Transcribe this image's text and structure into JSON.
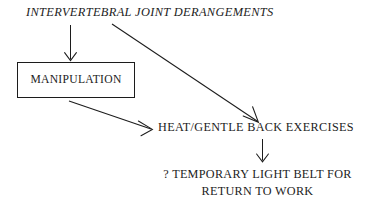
{
  "diagram": {
    "type": "flowchart",
    "title_node": "INTERVERTEBRAL JOINT DERANGEMENTS",
    "background_color": "#ffffff",
    "ink_color": "#1c1c1c",
    "nodes": [
      {
        "id": "derangements",
        "label": "INTERVERTEBRAL JOINT DERANGEMENTS",
        "style": "italic-caps",
        "boxed": false
      },
      {
        "id": "manipulation",
        "label": "MANIPULATION",
        "style": "roman-caps",
        "boxed": true
      },
      {
        "id": "heat",
        "label": "HEAT/GENTLE BACK EXERCISES",
        "style": "roman-caps",
        "boxed": false
      },
      {
        "id": "belt",
        "label_line_1": "? TEMPORARY LIGHT BELT FOR",
        "label_line_2": "RETURN TO WORK",
        "style": "roman-caps",
        "boxed": false
      }
    ],
    "edges": [
      {
        "id": "derangements-to-manipulation",
        "from": "derangements",
        "to": "manipulation",
        "direction": "down",
        "arrowhead": "open"
      },
      {
        "id": "derangements-to-heat",
        "from": "derangements",
        "to": "heat",
        "direction": "down-right",
        "arrowhead": "open"
      },
      {
        "id": "manipulation-to-heat",
        "from": "manipulation",
        "to": "heat",
        "direction": "down-right",
        "arrowhead": "open"
      },
      {
        "id": "heat-to-belt",
        "from": "heat",
        "to": "belt",
        "direction": "down",
        "arrowhead": "open"
      }
    ]
  }
}
